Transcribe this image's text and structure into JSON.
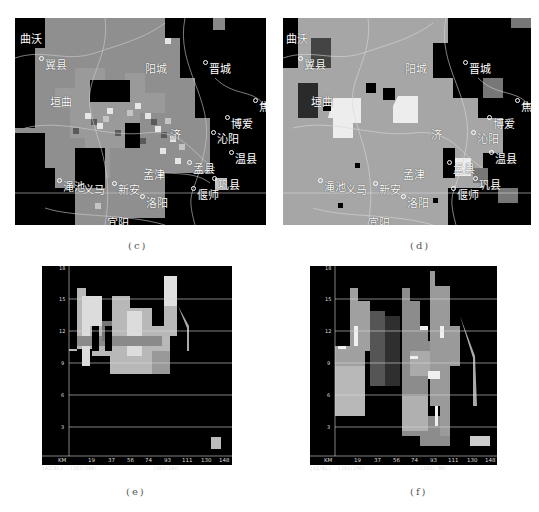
{
  "panels": {
    "c": {
      "caption": "(c)",
      "labels": [
        {
          "text": "曲沃",
          "x": 5,
          "y": 12,
          "dot": false
        },
        {
          "text": "翼县",
          "x": 24,
          "y": 38,
          "dot": true
        },
        {
          "text": "阳城",
          "x": 130,
          "y": 42,
          "dot": false
        },
        {
          "text": "晋城",
          "x": 188,
          "y": 42,
          "dot": true
        },
        {
          "text": "垣曲",
          "x": 35,
          "y": 75,
          "dot": false
        },
        {
          "text": "焦",
          "x": 238,
          "y": 80,
          "dot": true
        },
        {
          "text": "博爱",
          "x": 210,
          "y": 97,
          "dot": true
        },
        {
          "text": "沁阳",
          "x": 196,
          "y": 112,
          "dot": true
        },
        {
          "text": "济",
          "x": 155,
          "y": 108,
          "dot": false
        },
        {
          "text": "温县",
          "x": 214,
          "y": 132,
          "dot": true
        },
        {
          "text": "孟县",
          "x": 172,
          "y": 142,
          "dot": true
        },
        {
          "text": "孟津",
          "x": 128,
          "y": 148,
          "dot": false
        },
        {
          "text": "巩县",
          "x": 197,
          "y": 158,
          "dot": true
        },
        {
          "text": "渑池",
          "x": 42,
          "y": 160,
          "dot": true
        },
        {
          "text": "义马",
          "x": 68,
          "y": 163,
          "dot": false
        },
        {
          "text": "新安",
          "x": 97,
          "y": 163,
          "dot": true
        },
        {
          "text": "偃师",
          "x": 176,
          "y": 168,
          "dot": true
        },
        {
          "text": "洛阳",
          "x": 125,
          "y": 176,
          "dot": true
        },
        {
          "text": "宜阳",
          "x": 92,
          "y": 196,
          "dot": false
        }
      ]
    },
    "d": {
      "caption": "(d)",
      "labels": [
        {
          "text": "曲沃",
          "x": 3,
          "y": 12,
          "dot": false
        },
        {
          "text": "翼县",
          "x": 15,
          "y": 38,
          "dot": true
        },
        {
          "text": "阳城",
          "x": 122,
          "y": 42,
          "dot": false
        },
        {
          "text": "晋城",
          "x": 180,
          "y": 42,
          "dot": true
        },
        {
          "text": "垣曲",
          "x": 28,
          "y": 75,
          "dot": false
        },
        {
          "text": "焦",
          "x": 232,
          "y": 80,
          "dot": true
        },
        {
          "text": "博爱",
          "x": 204,
          "y": 97,
          "dot": true
        },
        {
          "text": "沁阳",
          "x": 188,
          "y": 112,
          "dot": true
        },
        {
          "text": "济",
          "x": 148,
          "y": 108,
          "dot": false
        },
        {
          "text": "温县",
          "x": 206,
          "y": 132,
          "dot": true
        },
        {
          "text": "孟县",
          "x": 164,
          "y": 142,
          "dot": true
        },
        {
          "text": "孟津",
          "x": 120,
          "y": 148,
          "dot": false
        },
        {
          "text": "巩县",
          "x": 190,
          "y": 158,
          "dot": true
        },
        {
          "text": "渑池",
          "x": 35,
          "y": 160,
          "dot": true
        },
        {
          "text": "义马",
          "x": 62,
          "y": 163,
          "dot": false
        },
        {
          "text": "新安",
          "x": 90,
          "y": 163,
          "dot": true
        },
        {
          "text": "偃师",
          "x": 168,
          "y": 168,
          "dot": true
        },
        {
          "text": "洛阳",
          "x": 118,
          "y": 176,
          "dot": true
        },
        {
          "text": "宜阳",
          "x": 85,
          "y": 196,
          "dot": false
        }
      ]
    },
    "e": {
      "caption": "(e)",
      "y_ticks": [
        "18",
        "15",
        "12",
        "9",
        "6",
        "3"
      ],
      "x_unit": "KM",
      "x_ticks": [
        "19",
        "37",
        "56",
        "74",
        "93",
        "111",
        "130",
        "148"
      ],
      "footer_left": "(AZ/EL)",
      "footer_mid": "(283/200)",
      "footer_right": "(283/100)"
    },
    "f": {
      "caption": "(f)",
      "y_ticks": [
        "18",
        "15",
        "12",
        "9",
        "6",
        "3"
      ],
      "x_unit": "KM",
      "x_ticks": [
        "19",
        "37",
        "56",
        "74",
        "93",
        "111",
        "130",
        "148"
      ],
      "footer_left": "(AZ/EL)",
      "footer_mid": "(283/190)",
      "footer_right": "(283/ 99)"
    }
  },
  "colors": {
    "background": "#ffffff",
    "echo_black": "#000000",
    "echo_dark": "#5a5a5a",
    "echo_mid": "#8c8c8c",
    "echo_light": "#b4b4b4",
    "echo_bright": "#e0e0e0",
    "grid": "#d0d0d0"
  }
}
